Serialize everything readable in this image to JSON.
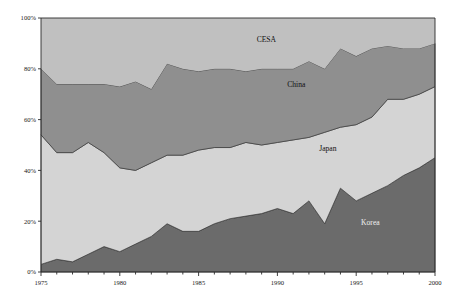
{
  "chart_data": {
    "type": "area",
    "title": "",
    "subtitle": "",
    "xlabel": "",
    "ylabel": "",
    "stacked": true,
    "normalized_percent": true,
    "grid": false,
    "legend_position": "inline-annotations",
    "xlim": [
      1975,
      2000
    ],
    "ylim": [
      0,
      100
    ],
    "ytick_labels": [
      "0%",
      "20%",
      "40%",
      "60%",
      "80%",
      "100%"
    ],
    "ytick_values": [
      0,
      20,
      40,
      60,
      80,
      100
    ],
    "xtick_labels": [
      "1975",
      "1980",
      "1985",
      "1990",
      "1995",
      "2000"
    ],
    "xtick_values": [
      1975,
      1980,
      1985,
      1990,
      1995,
      2000
    ],
    "minor_xticks_every": 1,
    "x": [
      1975,
      1976,
      1977,
      1978,
      1979,
      1980,
      1981,
      1982,
      1983,
      1984,
      1985,
      1986,
      1987,
      1988,
      1989,
      1990,
      1991,
      1992,
      1993,
      1994,
      1995,
      1996,
      1997,
      1998,
      1999,
      2000
    ],
    "series": [
      {
        "name": "Korea",
        "color": "#6b6b6b",
        "label_color": "#f0f0f0",
        "values": [
          3,
          5,
          4,
          7,
          10,
          8,
          11,
          14,
          19,
          16,
          16,
          19,
          21,
          22,
          23,
          25,
          23,
          28,
          19,
          33,
          28,
          31,
          34,
          38,
          41,
          45
        ]
      },
      {
        "name": "Japan",
        "color": "#d4d4d4",
        "label_color": "#111111",
        "values": [
          51,
          42,
          43,
          44,
          37,
          33,
          29,
          29,
          27,
          30,
          32,
          30,
          28,
          29,
          27,
          26,
          29,
          25,
          36,
          24,
          30,
          30,
          34,
          30,
          29,
          28
        ]
      },
      {
        "name": "China",
        "color": "#8f8f8f",
        "label_color": "#111111",
        "values": [
          26,
          27,
          27,
          23,
          27,
          32,
          35,
          29,
          36,
          34,
          31,
          31,
          31,
          28,
          30,
          29,
          28,
          30,
          25,
          31,
          27,
          27,
          21,
          20,
          18,
          17
        ]
      },
      {
        "name": "CESA",
        "color": "#c0c0c0",
        "label_color": "#111111",
        "values": [
          20,
          26,
          26,
          26,
          26,
          27,
          25,
          28,
          18,
          20,
          21,
          20,
          20,
          21,
          20,
          20,
          20,
          17,
          20,
          12,
          15,
          12,
          11,
          12,
          12,
          10
        ]
      }
    ],
    "annotations": [
      {
        "text": "CESA",
        "x": 1989.3,
        "y": 90.5
      },
      {
        "text": "China",
        "x": 1991.2,
        "y": 73.0
      },
      {
        "text": "Japan",
        "x": 1993.2,
        "y": 47.5
      },
      {
        "text": "Korea",
        "x": 1995.9,
        "y": 18.5
      }
    ]
  },
  "style": {
    "plot_background": "#d4d4d4",
    "axis_color": "#2b2b2b",
    "page_background": "#ffffff"
  }
}
